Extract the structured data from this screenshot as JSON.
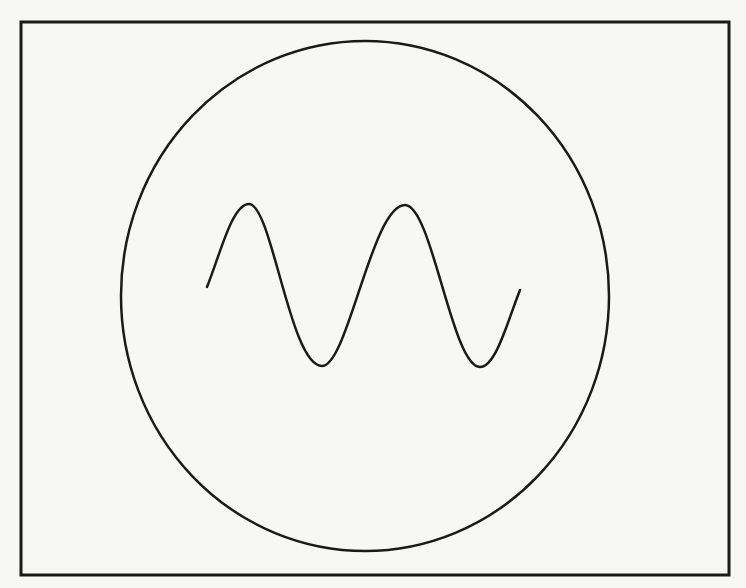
{
  "figure": {
    "colors": {
      "background": "#f7f7f5",
      "stroke": "#1a1a1a"
    },
    "frame": {
      "x": 21,
      "y": 22,
      "width": 708,
      "height": 553,
      "stroke_width": 3
    },
    "circle": {
      "cx": 365,
      "cy": 296,
      "rx": 244,
      "ry": 255,
      "stroke_width": 2.5
    },
    "wave": {
      "label": "sine-wave",
      "points": [
        [
          207,
          287
        ],
        [
          249,
          204
        ],
        [
          322,
          366
        ],
        [
          405,
          205
        ],
        [
          480,
          367
        ],
        [
          520,
          290
        ]
      ],
      "stroke_width": 2.5
    }
  }
}
